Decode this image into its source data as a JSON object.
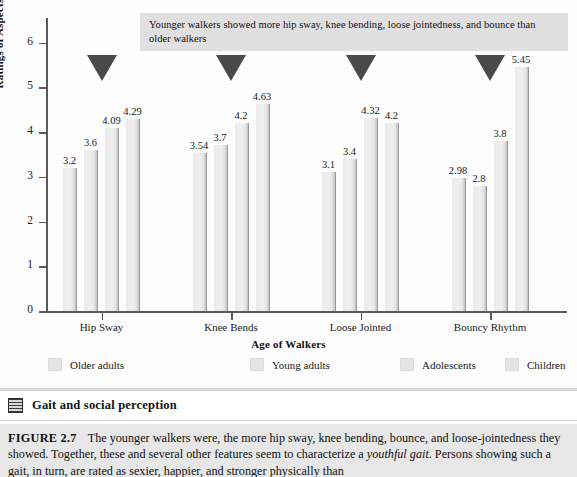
{
  "annotation": {
    "text": "Younger walkers showed more hip sway, knee bending, loose jointedness, and bounce than older walkers"
  },
  "banner": {
    "icon": "grid-thumbnail-icon",
    "title": "Gait and social perception"
  },
  "caption": {
    "label": "FIGURE 2.7",
    "part1": "The younger walkers were, the more hip sway, knee bending, bounce, and loose-jointedness they showed. Together, these and several other features seem to characterize a ",
    "italic1": "youthful gait",
    "part2": ". Persons showing such a gait, in turn, are rated as sexier, happier, and stronger physically than"
  },
  "chart_data": {
    "type": "bar",
    "title": "",
    "xlabel": "Age of Walkers",
    "ylabel": "Ratings of Aspects of Gait",
    "ylim": [
      0,
      6.5
    ],
    "yticks": [
      0,
      1,
      2,
      3,
      4,
      5,
      6
    ],
    "grid": false,
    "legend_position": "bottom",
    "categories": [
      "Hip Sway",
      "Knee Bends",
      "Loose Jointed",
      "Bouncy Rhythm"
    ],
    "series": [
      {
        "name": "Older adults",
        "values": [
          3.2,
          3.54,
          3.1,
          2.98
        ]
      },
      {
        "name": "Young adults",
        "values": [
          3.6,
          3.7,
          3.4,
          2.8
        ]
      },
      {
        "name": "Adolescents",
        "values": [
          4.09,
          4.2,
          4.32,
          3.8
        ]
      },
      {
        "name": "Children",
        "values": [
          4.29,
          4.63,
          4.2,
          5.45
        ]
      }
    ],
    "annotations": [
      {
        "marker": "down-triangle",
        "group": "Hip Sway"
      },
      {
        "marker": "down-triangle",
        "group": "Knee Bends"
      },
      {
        "marker": "down-triangle",
        "group": "Loose Jointed"
      },
      {
        "marker": "down-triangle",
        "group": "Bouncy Rhythm"
      }
    ]
  },
  "colors": {
    "bar_fill": "#ebebeb",
    "bar_edge": "#9a9a9a",
    "pointer": "#4a4a4a",
    "annotation_bg": "#e0e0e0",
    "caption_bg": "#e7e7e7",
    "axis": "#5a5a5a"
  }
}
